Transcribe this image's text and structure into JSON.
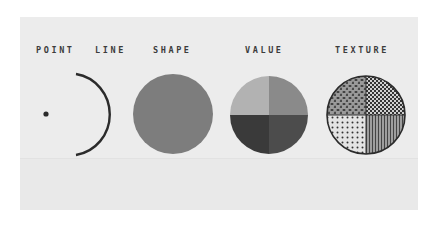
{
  "elements": [
    {
      "label": "POINT"
    },
    {
      "label": "LINE"
    },
    {
      "label": "SHAPE"
    },
    {
      "label": "VALUE"
    },
    {
      "label": "TEXTURE"
    }
  ],
  "colors": {
    "background": "#ececec",
    "ink": "#2b2b2b",
    "shape_fill": "#7d7d7d",
    "value_quadrants": [
      "#b2b2b2",
      "#8a8a8a",
      "#3a3a3a",
      "#4c4c4c"
    ]
  }
}
